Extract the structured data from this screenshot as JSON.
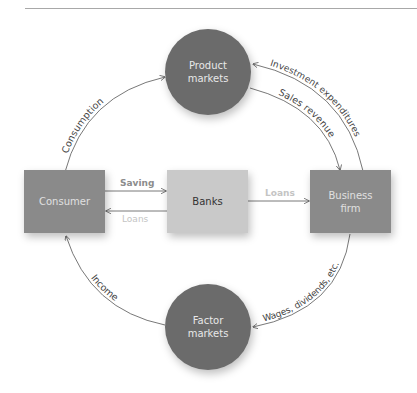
{
  "diagram": {
    "nodes": {
      "product_markets": {
        "label_line1": "Product",
        "label_line2": "markets"
      },
      "factor_markets": {
        "label_line1": "Factor",
        "label_line2": "markets"
      },
      "consumer": {
        "label": "Consumer"
      },
      "banks": {
        "label": "Banks"
      },
      "business_firm": {
        "label_line1": "Business",
        "label_line2": "firm"
      }
    },
    "flows": {
      "consumption": "Consumption",
      "investment_expenditures": "Investment expenditures",
      "sales_revenue": "Sales revenue",
      "saving": "Saving",
      "loans_to_consumer": "Loans",
      "loans_to_business": "Loans",
      "wages": "Wages, dividends, etc.",
      "income": "Income"
    },
    "colors": {
      "circle_fill": "#6b6b6b",
      "dark_box_fill": "#8a8a8a",
      "bank_fill": "#c9c9c9",
      "arrow": "#555555",
      "saving_label": "#8c8c8c",
      "loans_label": "#c4c4c4",
      "white_text": "#e8e8e8"
    }
  }
}
